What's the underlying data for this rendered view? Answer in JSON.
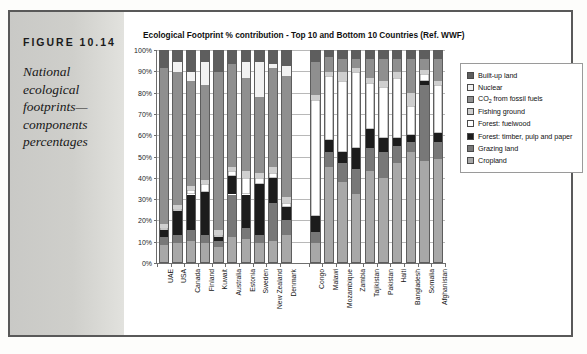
{
  "figure": {
    "number": "FIGURE 10.14",
    "caption": "National ecological footprints—components percentages"
  },
  "chart_data": {
    "type": "bar",
    "subtype": "stacked-percentage",
    "title": "Ecological Footprint % contribution - Top 10 and Bottom 10 Countries (Ref. WWF)",
    "xlabel": "",
    "ylabel": "",
    "ylim": [
      0,
      100
    ],
    "ytick_labels": [
      "0%",
      "10%",
      "20%",
      "30%",
      "40%",
      "50%",
      "60%",
      "70%",
      "80%",
      "90%",
      "100%"
    ],
    "ytick_values": [
      0,
      10,
      20,
      30,
      40,
      50,
      60,
      70,
      80,
      90,
      100
    ],
    "grid": true,
    "legend_position": "right",
    "group_gap_after_index": 9,
    "categories": [
      "UAE",
      "USA",
      "Canada",
      "Finland",
      "Kuwait",
      "Australia",
      "Estonia",
      "Sweden",
      "New Zealand",
      "Denmark",
      "Congo",
      "Malawi",
      "Mozambique",
      "Zambia",
      "Tajikistan",
      "Pakistan",
      "Haiti",
      "Bangladesh",
      "Somalia",
      "Afghanistan"
    ],
    "series": [
      {
        "name": "Cropland",
        "color": "#a8a8a8",
        "values": [
          8,
          9,
          10,
          9,
          7,
          12,
          11,
          9,
          10,
          13,
          9,
          45,
          38,
          32,
          43,
          40,
          47,
          52,
          48,
          49
        ]
      },
      {
        "name": "Grazing land",
        "color": "#787878",
        "values": [
          4,
          4,
          5,
          4,
          3,
          20,
          5,
          4,
          18,
          7,
          5,
          7,
          9,
          12,
          11,
          12,
          8,
          5,
          36,
          8
        ]
      },
      {
        "name": "Forest: timber, pulp and paper",
        "color": "#1c1c1c",
        "values": [
          3,
          11,
          17,
          20,
          2,
          9,
          16,
          24,
          12,
          6,
          8,
          6,
          5,
          10,
          9,
          7,
          4,
          3,
          2,
          4
        ]
      },
      {
        "name": "Forest: fuelwood",
        "color": "#ffffff",
        "values": [
          1,
          1,
          2,
          4,
          1,
          2,
          8,
          3,
          2,
          2,
          55,
          30,
          34,
          36,
          22,
          24,
          28,
          14,
          3,
          23
        ]
      },
      {
        "name": "Fishing ground",
        "color": "#cfcfcf",
        "values": [
          2,
          2,
          2,
          2,
          2,
          2,
          3,
          2,
          3,
          3,
          2,
          2,
          4,
          2,
          2,
          3,
          3,
          6,
          2,
          2
        ]
      },
      {
        "name": "CO2 from fossil fuels",
        "color": "#8f8f8f",
        "values": [
          74,
          63,
          50,
          45,
          75,
          49,
          44,
          36,
          47,
          57,
          16,
          7,
          6,
          4,
          9,
          10,
          6,
          16,
          5,
          10
        ]
      },
      {
        "name": "Nuclear",
        "color": "#f2f2f2",
        "values": [
          0,
          5,
          4,
          11,
          0,
          0,
          8,
          17,
          2,
          5,
          0,
          0,
          0,
          0,
          0,
          0,
          0,
          0,
          0,
          0
        ]
      },
      {
        "name": "Built-up land",
        "color": "#5e5e5e",
        "values": [
          8,
          5,
          10,
          5,
          10,
          6,
          5,
          5,
          6,
          7,
          5,
          3,
          4,
          4,
          4,
          4,
          4,
          4,
          4,
          4
        ]
      }
    ],
    "legend_entries": [
      {
        "label": "Built-up land",
        "color": "#5e5e5e"
      },
      {
        "label": "Nuclear",
        "color": "#f2f2f2"
      },
      {
        "label": "CO2 from fossil fuels",
        "color": "#8f8f8f",
        "html": "CO<sub>2</sub> from fossil fuels"
      },
      {
        "label": "Fishing ground",
        "color": "#cfcfcf"
      },
      {
        "label": "Forest: fuelwood",
        "color": "#ffffff"
      },
      {
        "label": "Forest: timber, pulp and paper",
        "color": "#1c1c1c"
      },
      {
        "label": "Grazing land",
        "color": "#787878"
      },
      {
        "label": "Cropland",
        "color": "#a8a8a8"
      }
    ]
  }
}
